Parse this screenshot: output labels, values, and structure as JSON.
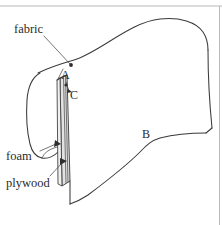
{
  "figure": {
    "background_color": "#ffffff",
    "line_color": "#3a3a3a",
    "frame_color": "#b9b9b9",
    "slab_fill_color": "#e2e2e2",
    "labels": {
      "fabric": "fabric",
      "foam": "foam",
      "plywood": "plywood",
      "point_a": "A",
      "point_b": "B",
      "point_c": "C"
    }
  }
}
